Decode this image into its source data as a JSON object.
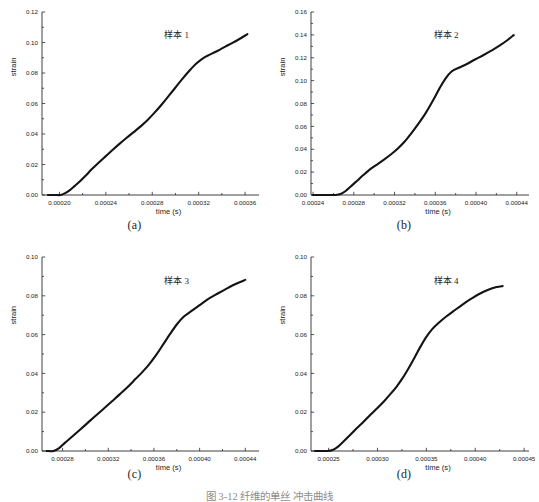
{
  "figure": {
    "caption": "图 3-12  纤维的单丝 冲击曲线",
    "panel_captions": [
      "(a)",
      "(b)",
      "(c)",
      "(d)"
    ],
    "curve_color": "#141414",
    "axis_color": "#2b2b2b",
    "background": "#ffffff"
  },
  "chart_data": [
    {
      "type": "line",
      "panel": "(a)",
      "title": "",
      "series_label": "样本 1",
      "xlabel": "time  (s)",
      "ylabel": "strain",
      "xlim": [
        0.000185,
        0.000372
      ],
      "ylim": [
        0.0,
        0.12
      ],
      "xticks": [
        0.0002,
        0.00024,
        0.00028,
        0.00032,
        0.00036
      ],
      "xtick_labels": [
        "0.00020",
        "0.00024",
        "0.00028",
        "0.00032",
        "0.00036"
      ],
      "yticks": [
        0.0,
        0.02,
        0.04,
        0.06,
        0.08,
        0.1,
        0.12
      ],
      "ytick_labels": [
        "0.00",
        "0.02",
        "0.04",
        "0.06",
        "0.08",
        "0.10",
        "0.12"
      ],
      "grid": false,
      "legend": "none",
      "x": [
        0.00019,
        0.000196,
        0.000201,
        0.000205,
        0.000209,
        0.000213,
        0.000218,
        0.000223,
        0.000228,
        0.000234,
        0.00024,
        0.000246,
        0.000252,
        0.000258,
        0.000264,
        0.00027,
        0.000276,
        0.000282,
        0.000288,
        0.000294,
        0.0003,
        0.000306,
        0.000312,
        0.000318,
        0.000324,
        0.00033,
        0.000338,
        0.000346,
        0.000354,
        0.000362
      ],
      "values": [
        0.0,
        0.0,
        0.0,
        0.0012,
        0.0032,
        0.0058,
        0.0092,
        0.013,
        0.017,
        0.0213,
        0.0255,
        0.0297,
        0.0337,
        0.0375,
        0.0412,
        0.045,
        0.0492,
        0.054,
        0.0592,
        0.0648,
        0.0705,
        0.0762,
        0.0815,
        0.0862,
        0.0898,
        0.0922,
        0.0952,
        0.0985,
        0.1018,
        0.1055
      ]
    },
    {
      "type": "line",
      "panel": "(b)",
      "title": "",
      "series_label": "样本 2",
      "xlabel": "time  (s)",
      "ylabel": "strain",
      "xlim": [
        0.000238,
        0.000452
      ],
      "ylim": [
        0.0,
        0.16
      ],
      "xticks": [
        0.00024,
        0.00028,
        0.00032,
        0.00036,
        0.0004,
        0.00044
      ],
      "xtick_labels": [
        "0.00024",
        "0.00028",
        "0.00032",
        "0.00036",
        "0.00040",
        "0.00044"
      ],
      "yticks": [
        0.0,
        0.02,
        0.04,
        0.06,
        0.08,
        0.1,
        0.12,
        0.14,
        0.16
      ],
      "ytick_labels": [
        "0.00",
        "0.02",
        "0.04",
        "0.06",
        "0.08",
        "0.10",
        "0.12",
        "0.14",
        "0.16"
      ],
      "grid": false,
      "legend": "none",
      "x": [
        0.00024,
        0.000248,
        0.000256,
        0.000262,
        0.000267,
        0.000272,
        0.000277,
        0.000283,
        0.000289,
        0.000295,
        0.000302,
        0.000309,
        0.000316,
        0.000323,
        0.00033,
        0.000337,
        0.000344,
        0.000351,
        0.000358,
        0.000364,
        0.00037,
        0.000376,
        0.000383,
        0.000391,
        0.000399,
        0.000407,
        0.000415,
        0.000423,
        0.000431,
        0.000437
      ],
      "values": [
        0.0,
        0.0,
        0.0,
        0.0,
        0.0008,
        0.0035,
        0.0075,
        0.0122,
        0.0172,
        0.0218,
        0.0262,
        0.0305,
        0.0352,
        0.0405,
        0.0468,
        0.0545,
        0.063,
        0.0722,
        0.083,
        0.093,
        0.1018,
        0.108,
        0.1112,
        0.1145,
        0.1185,
        0.1222,
        0.1262,
        0.1305,
        0.1355,
        0.1398
      ]
    },
    {
      "type": "line",
      "panel": "(c)",
      "title": "",
      "series_label": "样本 3",
      "xlabel": "time  (s)",
      "ylabel": "strain",
      "xlim": [
        0.000262,
        0.000452
      ],
      "ylim": [
        0.0,
        0.1
      ],
      "xticks": [
        0.00028,
        0.00032,
        0.00036,
        0.0004,
        0.00044
      ],
      "xtick_labels": [
        "0.00028",
        "0.00032",
        "0.00036",
        "0.00040",
        "0.00044"
      ],
      "yticks": [
        0.0,
        0.02,
        0.04,
        0.06,
        0.08,
        0.1
      ],
      "ytick_labels": [
        "0.00",
        "0.02",
        "0.04",
        "0.06",
        "0.08",
        "0.10"
      ],
      "grid": false,
      "legend": "none",
      "x": [
        0.000266,
        0.000272,
        0.000277,
        0.000282,
        0.000288,
        0.000295,
        0.000302,
        0.000309,
        0.000316,
        0.000323,
        0.00033,
        0.000337,
        0.000344,
        0.00035,
        0.000356,
        0.000362,
        0.000368,
        0.000374,
        0.00038,
        0.000386,
        0.000393,
        0.0004,
        0.000408,
        0.000416,
        0.000424,
        0.000432,
        0.00044
      ],
      "values": [
        0.0,
        0.0,
        0.0015,
        0.0042,
        0.0072,
        0.0108,
        0.0145,
        0.0182,
        0.0218,
        0.0255,
        0.0292,
        0.033,
        0.0372,
        0.0408,
        0.0448,
        0.0495,
        0.0548,
        0.0602,
        0.0652,
        0.0692,
        0.0722,
        0.0752,
        0.0785,
        0.0812,
        0.0838,
        0.0862,
        0.0882
      ]
    },
    {
      "type": "line",
      "panel": "(d)",
      "title": "",
      "series_label": "样本 4",
      "xlabel": "time  (s)",
      "ylabel": "strain",
      "xlim": [
        0.000232,
        0.000455
      ],
      "ylim": [
        0.0,
        0.1
      ],
      "xticks": [
        0.00025,
        0.0003,
        0.00035,
        0.0004,
        0.00045
      ],
      "xtick_labels": [
        "0.00025",
        "0.00030",
        "0.00035",
        "0.00040",
        "0.00045"
      ],
      "yticks": [
        0.0,
        0.02,
        0.04,
        0.06,
        0.08,
        0.1
      ],
      "ytick_labels": [
        "0.00",
        "0.02",
        "0.04",
        "0.06",
        "0.08",
        "0.10"
      ],
      "grid": false,
      "legend": "none",
      "x": [
        0.000236,
        0.000243,
        0.000249,
        0.000254,
        0.000259,
        0.000265,
        0.000272,
        0.000279,
        0.000286,
        0.000293,
        0.0003,
        0.000307,
        0.000314,
        0.00032,
        0.000326,
        0.000332,
        0.000338,
        0.000344,
        0.00035,
        0.000356,
        0.000363,
        0.00037,
        0.000378,
        0.000387,
        0.000396,
        0.000405,
        0.000414,
        0.000422,
        0.000428
      ],
      "values": [
        0.0,
        0.0,
        0.0,
        0.0005,
        0.002,
        0.0048,
        0.0082,
        0.0118,
        0.0152,
        0.0188,
        0.0222,
        0.0258,
        0.0298,
        0.0335,
        0.0378,
        0.0428,
        0.0482,
        0.0538,
        0.0588,
        0.0628,
        0.0662,
        0.0692,
        0.0722,
        0.0755,
        0.0785,
        0.0812,
        0.0832,
        0.0845,
        0.085
      ]
    }
  ]
}
